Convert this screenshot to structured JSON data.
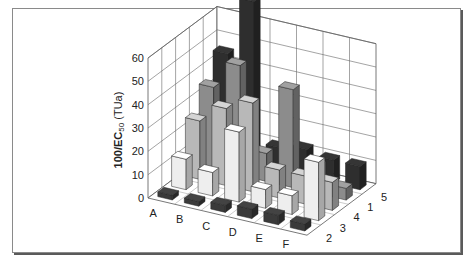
{
  "chart_data": {
    "type": "bar3d",
    "title": "",
    "xlabel": "",
    "ylabel": "100/EC50 (TUa)",
    "ylabel_parts": {
      "main": "100/EC",
      "sub": "50",
      "suffix": " (TUa)"
    },
    "ylim": [
      0,
      60
    ],
    "yticks": [
      0,
      10,
      20,
      30,
      40,
      50,
      60
    ],
    "categories": [
      "A",
      "B",
      "C",
      "D",
      "E",
      "F"
    ],
    "depth_labels_front_to_back": [
      "2",
      "3",
      "4",
      "1",
      "5"
    ],
    "series": [
      {
        "name": "2",
        "color": "#3a3a3a",
        "values": [
          2,
          2,
          3,
          4,
          4,
          3
        ]
      },
      {
        "name": "3",
        "color": "#eeeeee",
        "values": [
          13,
          10,
          30,
          8,
          8,
          25
        ]
      },
      {
        "name": "4",
        "color": "#b8b8b8",
        "values": [
          25,
          33,
          38,
          12,
          12,
          12
        ]
      },
      {
        "name": "1",
        "color": "#8c8c8c",
        "values": [
          35,
          47,
          12,
          42,
          12,
          5
        ]
      },
      {
        "name": "5",
        "color": "#2e2e2e",
        "values": [
          45,
          70,
          10,
          12,
          10,
          10
        ]
      }
    ],
    "grid": true,
    "legend": "none"
  }
}
